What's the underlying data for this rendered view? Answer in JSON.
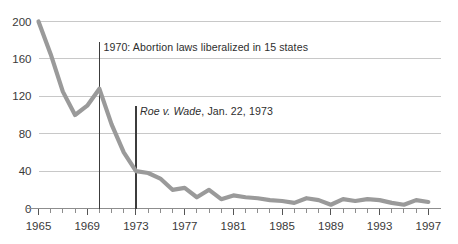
{
  "chart_data": {
    "type": "line",
    "title": "",
    "subtitle": "",
    "xlabel": "",
    "ylabel": "",
    "xlim": [
      1965,
      1998
    ],
    "ylim": [
      0,
      200
    ],
    "grid": true,
    "legend_position": "none",
    "y_ticks": [
      0,
      40,
      80,
      120,
      160,
      200
    ],
    "y_tick_labels": [
      "0",
      "40",
      "80",
      "120",
      "160",
      "200"
    ],
    "x_ticks": [
      1965,
      1969,
      1973,
      1977,
      1981,
      1985,
      1989,
      1993,
      1997
    ],
    "x_tick_labels": [
      "1965",
      "1969",
      "1973",
      "1977",
      "1981",
      "1985",
      "1989",
      "1993",
      "1997"
    ],
    "x_minor_tick_step": 1,
    "series": [
      {
        "name": "deaths",
        "color": "#9a9a9a",
        "x": [
          1965,
          1966,
          1967,
          1968,
          1969,
          1970,
          1971,
          1972,
          1973,
          1974,
          1975,
          1976,
          1977,
          1978,
          1979,
          1980,
          1981,
          1982,
          1983,
          1984,
          1985,
          1986,
          1987,
          1988,
          1989,
          1990,
          1991,
          1992,
          1993,
          1994,
          1995,
          1996,
          1997
        ],
        "values": [
          200,
          165,
          125,
          100,
          110,
          128,
          90,
          60,
          40,
          38,
          32,
          20,
          22,
          12,
          20,
          10,
          14,
          12,
          11,
          9,
          8,
          6,
          11,
          9,
          4,
          10,
          8,
          10,
          9,
          6,
          4,
          9,
          7
        ]
      }
    ],
    "annotations": [
      {
        "id": "law-liberalization",
        "x": 1970,
        "text": "1970: Abortion laws liberalized in 15 states",
        "rule_top_value": 178,
        "rule_bottom_value": 0
      },
      {
        "id": "roe-v-wade",
        "x": 1973,
        "text_italic": "Roe v. Wade",
        "text_rest": ", Jan. 22, 1973",
        "rule_top_value": 110,
        "rule_bottom_value": 0
      }
    ],
    "colors": {
      "series": "#9a9a9a",
      "grid": "#c8c8c8",
      "axis": "#8d8d8d",
      "event_rule": "#3c3c3c",
      "text": "#3a3a3a",
      "background": "#ffffff"
    }
  }
}
